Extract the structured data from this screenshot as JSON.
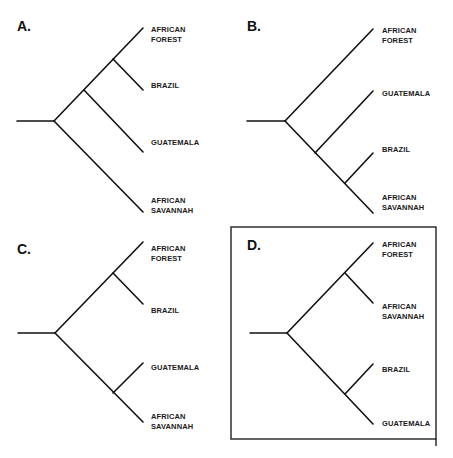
{
  "figure": {
    "type": "phylogenetic-trees",
    "panels": [
      {
        "id": "A",
        "label": "A.",
        "highlighted": false,
        "tree": "(((AFRICAN FOREST, BRAZIL), GUATEMALA), AFRICAN SAVANNAH)",
        "taxa": [
          {
            "lines": [
              "AFRICAN",
              "FOREST"
            ]
          },
          {
            "lines": [
              "BRAZIL"
            ]
          },
          {
            "lines": [
              "GUATEMALA"
            ]
          },
          {
            "lines": [
              "AFRICAN",
              "SAVANNAH"
            ]
          }
        ]
      },
      {
        "id": "B",
        "label": "B.",
        "highlighted": false,
        "tree": "(AFRICAN FOREST, (GUATEMALA, (BRAZIL, AFRICAN SAVANNAH)))",
        "taxa": [
          {
            "lines": [
              "AFRICAN",
              "FOREST"
            ]
          },
          {
            "lines": [
              "GUATEMALA"
            ]
          },
          {
            "lines": [
              "BRAZIL"
            ]
          },
          {
            "lines": [
              "AFRICAN",
              "SAVANNAH"
            ]
          }
        ]
      },
      {
        "id": "C",
        "label": "C.",
        "highlighted": false,
        "tree": "((AFRICAN FOREST, BRAZIL), (GUATEMALA, AFRICAN SAVANNAH))",
        "taxa": [
          {
            "lines": [
              "AFRICAN",
              "FOREST"
            ]
          },
          {
            "lines": [
              "BRAZIL"
            ]
          },
          {
            "lines": [
              "GUATEMALA"
            ]
          },
          {
            "lines": [
              "AFRICAN",
              "SAVANNAH"
            ]
          }
        ]
      },
      {
        "id": "D",
        "label": "D.",
        "highlighted": true,
        "tree": "((AFRICAN FOREST, AFRICAN SAVANNAH), (BRAZIL, GUATEMALA))",
        "taxa": [
          {
            "lines": [
              "AFRICAN",
              "FOREST"
            ]
          },
          {
            "lines": [
              "AFRICAN",
              "SAVANNAH"
            ]
          },
          {
            "lines": [
              "BRAZIL"
            ]
          },
          {
            "lines": [
              "GUATEMALA"
            ]
          }
        ]
      }
    ]
  }
}
